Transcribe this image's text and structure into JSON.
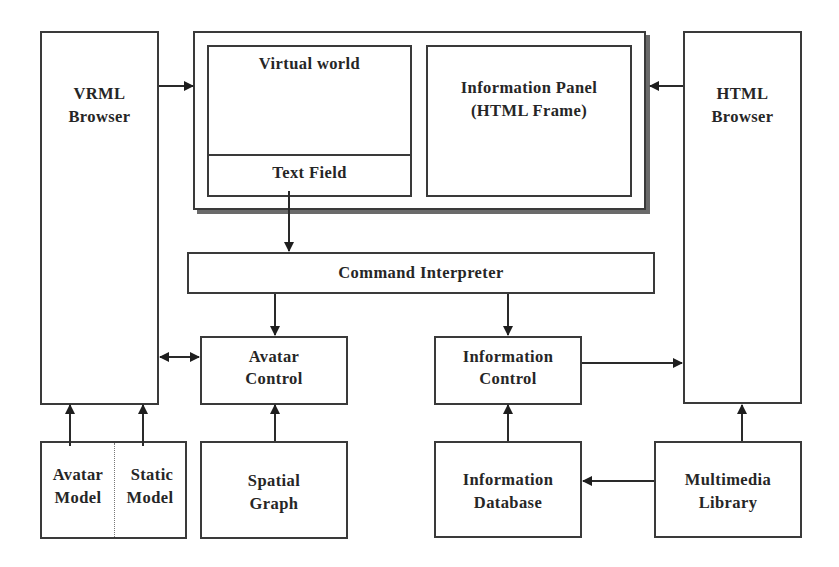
{
  "diagram": {
    "vrml_browser": {
      "line1": "VRML",
      "line2": "Browser"
    },
    "html_browser": {
      "line1": "HTML",
      "line2": "Browser"
    },
    "window": {
      "virtual_world": "Virtual world",
      "text_field": "Text Field",
      "info_panel": {
        "line1": "Information Panel",
        "line2": "(HTML Frame)"
      }
    },
    "command_interpreter": "Command Interpreter",
    "avatar_control": {
      "line1": "Avatar",
      "line2": "Control"
    },
    "information_control": {
      "line1": "Information",
      "line2": "Control"
    },
    "avatar_model": {
      "line1": "Avatar",
      "line2": "Model"
    },
    "static_model": {
      "line1": "Static",
      "line2": "Model"
    },
    "spatial_graph": {
      "line1": "Spatial",
      "line2": "Graph"
    },
    "information_database": {
      "line1": "Information",
      "line2": "Database"
    },
    "multimedia_library": {
      "line1": "Multimedia",
      "line2": "Library"
    },
    "edges": [
      {
        "from": "VRML Browser",
        "to": "Virtual world",
        "type": "arrow"
      },
      {
        "from": "HTML Browser",
        "to": "Information Panel (HTML Frame)",
        "type": "arrow"
      },
      {
        "from": "Text Field",
        "to": "Command Interpreter",
        "type": "arrow"
      },
      {
        "from": "Command Interpreter",
        "to": "Avatar Control",
        "type": "arrow"
      },
      {
        "from": "Command Interpreter",
        "to": "Information Control",
        "type": "arrow"
      },
      {
        "from": "Avatar Control",
        "to": "VRML Browser",
        "type": "bidirectional"
      },
      {
        "from": "Information Control",
        "to": "HTML Browser",
        "type": "arrow"
      },
      {
        "from": "Avatar Model",
        "to": "VRML Browser",
        "type": "arrow"
      },
      {
        "from": "Static Model",
        "to": "VRML Browser",
        "type": "arrow"
      },
      {
        "from": "Spatial Graph",
        "to": "Avatar Control",
        "type": "arrow"
      },
      {
        "from": "Information Database",
        "to": "Information Control",
        "type": "arrow"
      },
      {
        "from": "Multimedia Library",
        "to": "Information Database",
        "type": "arrow"
      },
      {
        "from": "Multimedia Library",
        "to": "HTML Browser",
        "type": "arrow"
      }
    ]
  }
}
